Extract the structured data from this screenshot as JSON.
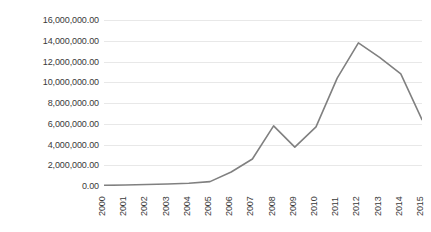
{
  "chart_data": {
    "type": "line",
    "title": "",
    "xlabel": "",
    "ylabel": "",
    "categories": [
      "2000",
      "2001",
      "2002",
      "2003",
      "2004",
      "2005",
      "2006",
      "2007",
      "2008",
      "2009",
      "2010",
      "2011",
      "2012",
      "2013",
      "2014",
      "2015"
    ],
    "values": [
      60000,
      100000,
      150000,
      200000,
      260000,
      420000,
      1350000,
      2600000,
      5800000,
      3750000,
      5700000,
      10400000,
      13800000,
      12400000,
      10800000,
      6400000
    ],
    "series": [
      {
        "name": "series-1",
        "values": [
          60000,
          100000,
          150000,
          200000,
          260000,
          420000,
          1350000,
          2600000,
          5800000,
          3750000,
          5700000,
          10400000,
          13800000,
          12400000,
          10800000,
          6400000
        ]
      }
    ],
    "ylim": [
      0,
      16000000
    ],
    "y_tick_step": 2000000,
    "y_tick_labels": [
      "0.00",
      "2,000,000.00",
      "4,000,000.00",
      "6,000,000.00",
      "8,000,000.00",
      "10,000,000.00",
      "12,000,000.00",
      "14,000,000.00",
      "16,000,000.00"
    ],
    "y_tick_values": [
      0,
      2000000,
      4000000,
      6000000,
      8000000,
      10000000,
      12000000,
      14000000,
      16000000
    ],
    "grid": {
      "horizontal": true,
      "vertical": false
    },
    "legend": {
      "visible": false,
      "position": "none"
    },
    "markers": false,
    "colors": {
      "line": "#808080",
      "gridline": "#e8e8e8",
      "baseline": "#d4d4d4",
      "axis_text": "#3a3a3a",
      "background": "#ffffff"
    },
    "x_label_rotation": -90
  }
}
